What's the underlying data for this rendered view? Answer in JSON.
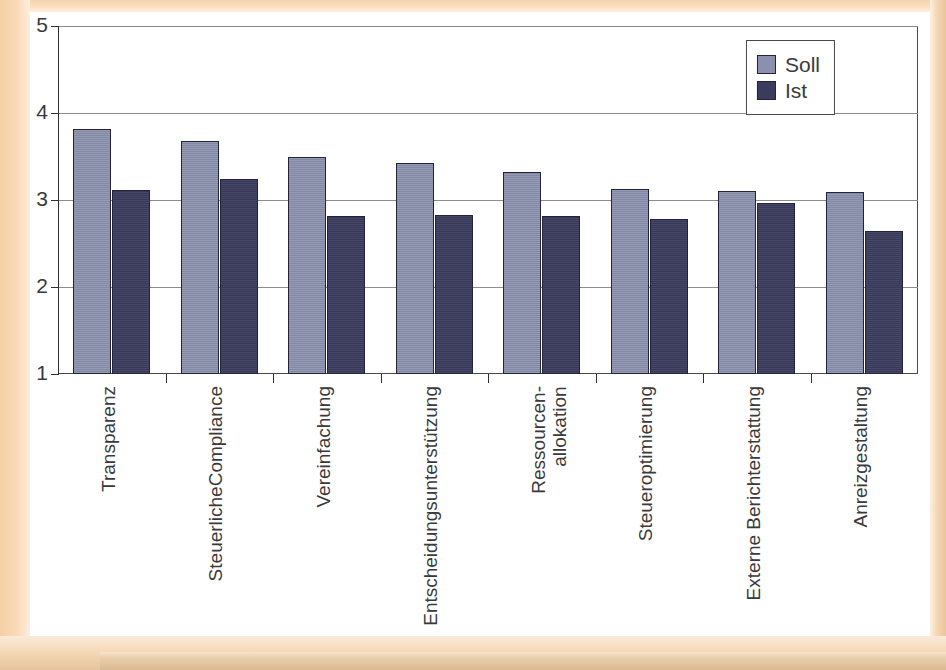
{
  "chart_data": {
    "type": "bar",
    "title": "",
    "subtitle": "",
    "xlabel": "",
    "ylabel": "",
    "ylim": [
      1,
      5
    ],
    "yticks": [
      1,
      2,
      3,
      4,
      5
    ],
    "ytick_labels": [
      "1",
      "2",
      "3",
      "4",
      "5"
    ],
    "grid": true,
    "legend_position": "top-right",
    "categories": [
      "Transparenz",
      "SteuerlicheCompliance",
      "Vereinfachung",
      "Entscheidungsunterstützung",
      "Ressourcen-\nallokation",
      "Steueroptimierung",
      "Externe Berichterstattung",
      "Anreizgestaltung"
    ],
    "series": [
      {
        "name": "Soll",
        "color": "#8a90ad",
        "values": [
          3.82,
          3.68,
          3.49,
          3.42,
          3.32,
          3.13,
          3.1,
          3.09
        ]
      },
      {
        "name": "Ist",
        "color": "#3b3b5e",
        "values": [
          3.12,
          3.24,
          2.82,
          2.83,
          2.82,
          2.78,
          2.96,
          2.64
        ]
      }
    ]
  },
  "legend": {
    "items": [
      {
        "label": "Soll",
        "color": "#8a90ad"
      },
      {
        "label": "Ist",
        "color": "#3b3b5e"
      }
    ]
  },
  "colors": {
    "soll": "#8a90ad",
    "ist": "#3b3b5e",
    "axis": "#2f2f2f",
    "grid": "#8c8c8c",
    "frame": "#f3d2ab",
    "text": "#3a3a3a"
  }
}
